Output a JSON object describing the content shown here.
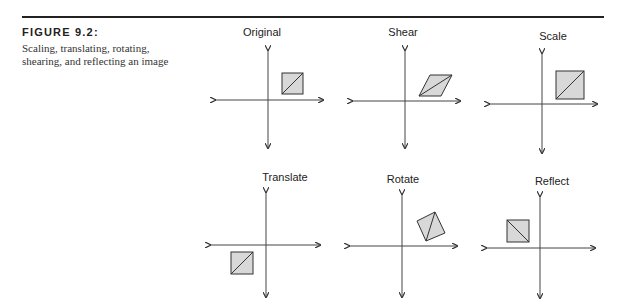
{
  "figure": {
    "label": "FIGURE 9.2:",
    "caption": "Scaling, translating, rotating, shearing, and reflecting an image"
  },
  "panels": [
    {
      "title": "Original"
    },
    {
      "title": "Shear"
    },
    {
      "title": "Scale"
    },
    {
      "title": "Translate"
    },
    {
      "title": "Rotate"
    },
    {
      "title": "Reflect"
    }
  ],
  "colors": {
    "shape_fill": "#d8d8d8",
    "stroke": "#333333",
    "axis": "#444444"
  }
}
